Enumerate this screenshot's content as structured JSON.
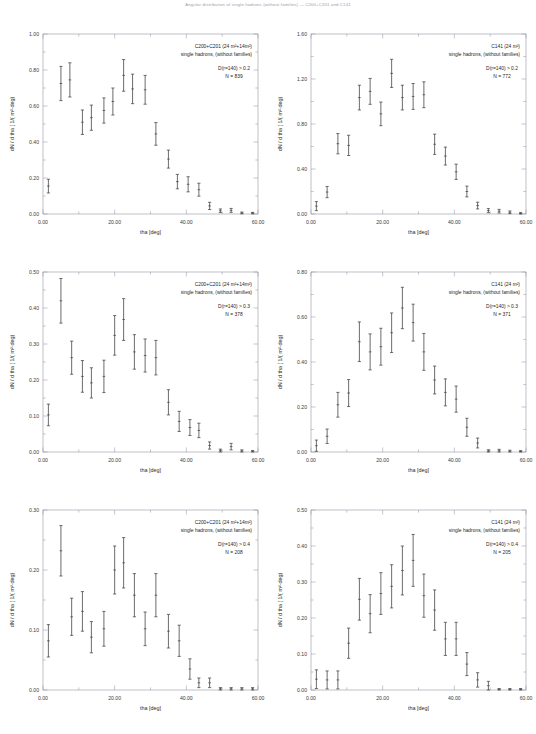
{
  "figure": {
    "suptitle": "Angular distribution of single hadrons (without families) — C200+C201 and C141",
    "width": 536,
    "height": 734
  },
  "axes": {
    "xlabel": "tha  [deg]",
    "ylabel": "dN / d tha   [ 1/( m²·deg)",
    "xticks": [
      "0.00",
      "20.00",
      "40.00",
      "60.00"
    ],
    "xlim": [
      0,
      60
    ]
  },
  "chart_data": [
    {
      "id": "panel-top-left",
      "type": "scatter",
      "title": "",
      "annotation": {
        "detector": "C200+C201   (24 m²+14m²)",
        "sample": "single hadrons, (without families)",
        "cut": "D(r=140) > 0.2",
        "count": "N = 839"
      },
      "xlabel": "tha  [deg]",
      "ylabel": "dN / d tha   [ 1/( m²·deg)",
      "xlim": [
        0,
        60
      ],
      "ylim": [
        0,
        1.0
      ],
      "yticks": [
        "0.00",
        "0.20",
        "0.40",
        "0.60",
        "0.80",
        "1.00"
      ],
      "ytickvals": [
        0,
        0.2,
        0.4,
        0.6,
        0.8,
        1.0
      ],
      "grid": false,
      "x": [
        1.5,
        5.0,
        7.5,
        11.0,
        13.5,
        17.0,
        19.5,
        22.5,
        25.0,
        28.5,
        31.5,
        35.0,
        37.5,
        40.5,
        43.5,
        46.5,
        49.5,
        52.5,
        55.5,
        58.5
      ],
      "y": [
        0.155,
        0.725,
        0.745,
        0.51,
        0.535,
        0.575,
        0.625,
        0.77,
        0.695,
        0.69,
        0.445,
        0.305,
        0.18,
        0.165,
        0.135,
        0.045,
        0.018,
        0.02,
        0.006,
        0.005
      ],
      "yerr": [
        0.038,
        0.095,
        0.095,
        0.068,
        0.07,
        0.07,
        0.075,
        0.088,
        0.082,
        0.08,
        0.063,
        0.05,
        0.04,
        0.042,
        0.036,
        0.02,
        0.01,
        0.011,
        0.005,
        0.004
      ]
    },
    {
      "id": "panel-top-right",
      "type": "scatter",
      "title": "",
      "annotation": {
        "detector": "C141   (24 m²)",
        "sample": "single hadrons, (without families)",
        "cut": "D(r=140) > 0.2",
        "count": "N = 772"
      },
      "xlabel": "tha  [deg]",
      "ylabel": "dN / d tha   [ 1/( m²·deg)",
      "xlim": [
        0,
        60
      ],
      "ylim": [
        0,
        1.6
      ],
      "yticks": [
        "0.00",
        "0.40",
        "0.80",
        "1.20",
        "1.60"
      ],
      "ytickvals": [
        0,
        0.4,
        0.8,
        1.2,
        1.6
      ],
      "grid": false,
      "x": [
        1.5,
        4.5,
        7.5,
        10.5,
        13.5,
        16.5,
        19.5,
        22.5,
        25.5,
        28.5,
        31.5,
        34.5,
        37.5,
        40.5,
        43.5,
        46.5,
        49.5,
        52.5,
        55.5,
        58.5
      ],
      "y": [
        0.07,
        0.195,
        0.625,
        0.61,
        1.035,
        1.09,
        0.89,
        1.25,
        1.035,
        1.045,
        1.06,
        0.62,
        0.515,
        0.375,
        0.2,
        0.075,
        0.03,
        0.025,
        0.015,
        0.006
      ],
      "yerr": [
        0.04,
        0.05,
        0.09,
        0.09,
        0.11,
        0.115,
        0.105,
        0.125,
        0.11,
        0.115,
        0.115,
        0.09,
        0.08,
        0.068,
        0.048,
        0.03,
        0.018,
        0.016,
        0.012,
        0.006
      ]
    },
    {
      "id": "panel-mid-left",
      "type": "scatter",
      "title": "",
      "annotation": {
        "detector": "C200+C201   (24 m²+14m²)",
        "sample": "single hadrons, (without families)",
        "cut": "D(r=140) > 0.3",
        "count": "N = 378"
      },
      "xlabel": "tha  [deg]",
      "ylabel": "dN / d tha   [ 1/( m²·deg)",
      "xlim": [
        0,
        60
      ],
      "ylim": [
        0,
        0.5
      ],
      "yticks": [
        "0.00",
        "0.10",
        "0.20",
        "0.30",
        "0.40",
        "0.50"
      ],
      "ytickvals": [
        0,
        0.1,
        0.2,
        0.3,
        0.4,
        0.5
      ],
      "grid": false,
      "x": [
        1.5,
        5.0,
        8.0,
        11.0,
        13.5,
        17.0,
        20.0,
        22.5,
        25.5,
        28.5,
        31.5,
        35.0,
        38.0,
        41.0,
        43.5,
        46.5,
        49.5,
        52.5,
        55.5,
        58.5
      ],
      "y": [
        0.103,
        0.42,
        0.262,
        0.21,
        0.192,
        0.21,
        0.324,
        0.368,
        0.278,
        0.268,
        0.262,
        0.138,
        0.085,
        0.068,
        0.06,
        0.018,
        0.004,
        0.015,
        0.003,
        0.002
      ],
      "yerr": [
        0.03,
        0.062,
        0.046,
        0.044,
        0.042,
        0.045,
        0.055,
        0.058,
        0.048,
        0.046,
        0.048,
        0.035,
        0.028,
        0.022,
        0.02,
        0.01,
        0.004,
        0.009,
        0.003,
        0.002
      ]
    },
    {
      "id": "panel-mid-right",
      "type": "scatter",
      "title": "",
      "annotation": {
        "detector": "C141   (24 m²)",
        "sample": "single hadrons, (without families)",
        "cut": "D(r=140) > 0.3",
        "count": "N = 371"
      },
      "xlabel": "tha  [deg]",
      "ylabel": "dN / d tha   [ 1/( m²·deg)",
      "xlim": [
        0,
        60
      ],
      "ylim": [
        0,
        0.8
      ],
      "yticks": [
        "0.00",
        "0.20",
        "0.40",
        "0.60",
        "0.80"
      ],
      "ytickvals": [
        0,
        0.2,
        0.4,
        0.6,
        0.8
      ],
      "grid": false,
      "x": [
        1.5,
        4.5,
        7.5,
        10.5,
        13.5,
        16.5,
        19.5,
        22.5,
        25.5,
        28.5,
        31.5,
        34.5,
        37.5,
        40.5,
        43.5,
        46.5,
        49.5,
        52.5,
        55.5,
        58.5
      ],
      "y": [
        0.028,
        0.07,
        0.21,
        0.262,
        0.49,
        0.445,
        0.468,
        0.53,
        0.64,
        0.575,
        0.445,
        0.32,
        0.265,
        0.235,
        0.11,
        0.04,
        0.005,
        0.006,
        0.004,
        0.003
      ],
      "yerr": [
        0.025,
        0.032,
        0.055,
        0.06,
        0.088,
        0.08,
        0.082,
        0.088,
        0.092,
        0.082,
        0.082,
        0.062,
        0.06,
        0.058,
        0.04,
        0.022,
        0.005,
        0.006,
        0.004,
        0.003
      ]
    },
    {
      "id": "panel-bot-left",
      "type": "scatter",
      "title": "",
      "annotation": {
        "detector": "C200+C201   (24 m²+14m²)",
        "sample": "single hadrons, (without families)",
        "cut": "D(r=140) > 0.4",
        "count": "N = 208"
      },
      "xlabel": "tha  [deg]",
      "ylabel": "dN / d tha   [ 1/( m²·deg)",
      "xlim": [
        0,
        60
      ],
      "ylim": [
        0,
        0.3
      ],
      "yticks": [
        "0.00",
        "0.10",
        "0.20",
        "0.30"
      ],
      "ytickvals": [
        0,
        0.1,
        0.2,
        0.3
      ],
      "grid": false,
      "x": [
        1.5,
        5.0,
        8.0,
        11.0,
        13.5,
        17.0,
        20.0,
        22.5,
        25.5,
        28.5,
        31.5,
        35.0,
        38.0,
        41.0,
        43.5,
        46.5,
        49.5,
        52.5,
        55.5,
        58.5
      ],
      "y": [
        0.082,
        0.232,
        0.122,
        0.131,
        0.088,
        0.102,
        0.2,
        0.212,
        0.158,
        0.102,
        0.158,
        0.098,
        0.082,
        0.035,
        0.012,
        0.012,
        0.002,
        0.002,
        0.002,
        0.002
      ],
      "yerr": [
        0.027,
        0.042,
        0.031,
        0.033,
        0.026,
        0.029,
        0.04,
        0.042,
        0.036,
        0.028,
        0.036,
        0.028,
        0.026,
        0.017,
        0.008,
        0.008,
        0.002,
        0.002,
        0.002,
        0.002
      ]
    },
    {
      "id": "panel-bot-right",
      "type": "scatter",
      "title": "",
      "annotation": {
        "detector": "C141   (24 m²)",
        "sample": "single hadrons, (without families)",
        "cut": "D(r=140) > 0.4",
        "count": "N = 205"
      },
      "xlabel": "tha  [deg]",
      "ylabel": "dN / d tha   [ 1/( m²·deg)",
      "xlim": [
        0,
        60
      ],
      "ylim": [
        0,
        0.5
      ],
      "yticks": [
        "0.00",
        "0.10",
        "0.20",
        "0.30",
        "0.40",
        "0.50"
      ],
      "ytickvals": [
        0,
        0.1,
        0.2,
        0.3,
        0.4,
        0.5
      ],
      "grid": false,
      "x": [
        1.5,
        4.5,
        7.5,
        10.5,
        13.5,
        16.5,
        19.5,
        22.5,
        25.5,
        28.5,
        31.5,
        34.5,
        37.5,
        40.5,
        43.5,
        46.5,
        49.5,
        52.5,
        55.5,
        58.5
      ],
      "y": [
        0.03,
        0.028,
        0.028,
        0.13,
        0.252,
        0.212,
        0.268,
        0.288,
        0.332,
        0.36,
        0.262,
        0.222,
        0.142,
        0.142,
        0.072,
        0.028,
        0.012,
        0.002,
        0.002,
        0.002
      ],
      "yerr": [
        0.026,
        0.025,
        0.025,
        0.042,
        0.058,
        0.053,
        0.058,
        0.06,
        0.068,
        0.072,
        0.06,
        0.056,
        0.046,
        0.046,
        0.032,
        0.02,
        0.012,
        0.002,
        0.002,
        0.002
      ]
    }
  ]
}
